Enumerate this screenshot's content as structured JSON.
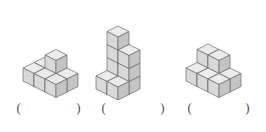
{
  "figures": [
    {
      "id": "figure-1",
      "origin": [
        45,
        70
      ],
      "cubes": [
        [
          0,
          0,
          0
        ],
        [
          1,
          0,
          0
        ],
        [
          0,
          1,
          0
        ],
        [
          1,
          1,
          0
        ],
        [
          2,
          1,
          0
        ],
        [
          1,
          0,
          1
        ],
        [
          2,
          0,
          0
        ]
      ]
    },
    {
      "id": "figure-2",
      "origin": [
        118,
        78
      ],
      "cubes": [
        [
          0,
          0,
          0
        ],
        [
          0,
          0,
          1
        ],
        [
          0,
          0,
          2
        ],
        [
          0,
          0,
          3
        ],
        [
          1,
          0,
          0
        ],
        [
          1,
          0,
          1
        ],
        [
          1,
          0,
          2
        ],
        [
          0,
          1,
          0
        ],
        [
          1,
          1,
          0
        ]
      ]
    },
    {
      "id": "figure-3",
      "origin": [
        208,
        70
      ],
      "cubes": [
        [
          0,
          0,
          0
        ],
        [
          1,
          0,
          0
        ],
        [
          0,
          0,
          1
        ],
        [
          1,
          0,
          1
        ],
        [
          0,
          1,
          0
        ],
        [
          1,
          1,
          0
        ],
        [
          2,
          0,
          0
        ],
        [
          2,
          1,
          0
        ]
      ]
    }
  ],
  "colors": {
    "top": "#ececec",
    "left": "#d9d9d9",
    "right": "#c4c4c4",
    "stroke": "#6a6a6a"
  },
  "answers": [
    {
      "open": "(",
      "value": "",
      "close": ")"
    },
    {
      "open": "(",
      "value": "",
      "close": ")"
    },
    {
      "open": "(",
      "value": "",
      "close": ")"
    }
  ]
}
